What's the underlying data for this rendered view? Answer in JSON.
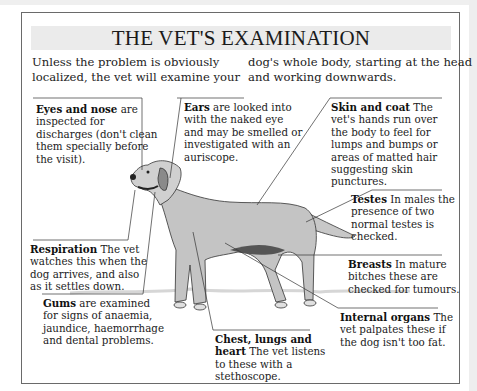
{
  "title": "THE VET'S EXAMINATION",
  "intro": {
    "col1_line1": "Unless the problem is obviously",
    "col1_line2": "localized, the vet will examine your",
    "col2_line1": "dog's whole body, starting at the head",
    "col2_line2": "and working downwards."
  },
  "illustration": {
    "subject": "dog-standing-side-view",
    "colors": {
      "ink": "#2a2a2a",
      "frame": "#6a6a6a",
      "title_band": "#ebebeb"
    }
  },
  "callouts": {
    "eyes_nose": {
      "heading": "Eyes and nose",
      "lines": [
        "are",
        "inspected for",
        "discharges (don't clean",
        "them specially before",
        "the visit)."
      ]
    },
    "ears": {
      "heading": "Ears",
      "lines": [
        "are looked into",
        "with the naked eye",
        "and may be smelled or",
        "investigated with an",
        "auriscope."
      ]
    },
    "skin_coat": {
      "heading": "Skin and coat",
      "lines": [
        "The",
        "vet's hands run over",
        "the body to feel for",
        "lumps and bumps or",
        "areas of matted hair",
        "suggesting skin",
        "punctures."
      ]
    },
    "testes": {
      "heading": "Testes",
      "lines": [
        "In males the",
        "presence of two",
        "normal testes is",
        "checked."
      ]
    },
    "respiration": {
      "heading": "Respiration",
      "lines": [
        "The vet",
        "watches this when the",
        "dog arrives, and also",
        "as it settles down."
      ]
    },
    "breasts": {
      "heading": "Breasts",
      "lines": [
        "In mature",
        "bitches these are",
        "checked for tumours."
      ]
    },
    "gums": {
      "heading": "Gums",
      "lines": [
        "are examined",
        "for signs of anaemia,",
        "jaundice, haemorrhage",
        "and dental problems."
      ]
    },
    "internal": {
      "heading": "Internal organs",
      "lines": [
        "The",
        "vet palpates these if",
        "the dog isn't too fat."
      ]
    },
    "chest": {
      "heading": "Chest, lungs and",
      "heading2": "heart",
      "lines": [
        "The vet listens",
        "to these with a",
        "stethoscope."
      ]
    }
  }
}
